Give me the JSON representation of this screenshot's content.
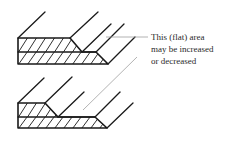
{
  "diagram": {
    "annotation": {
      "lines": [
        "This (flat) area",
        "may be increased",
        "or decreased"
      ]
    },
    "colors": {
      "stroke": "#1a1a1a",
      "leader": "#a0a0a0",
      "text": "#2a2a2a",
      "background": "#ffffff"
    },
    "figures": [
      {
        "name": "top-profile",
        "description": "Stepped joint profile with wide upper flat"
      },
      {
        "name": "bottom-profile",
        "description": "Stepped joint profile with narrow upper flat"
      }
    ]
  }
}
